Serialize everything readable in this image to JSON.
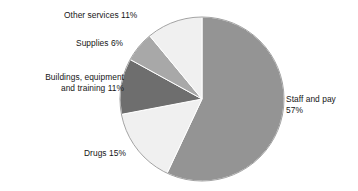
{
  "chart_data": {
    "type": "pie",
    "title": "",
    "subtitle": "",
    "xlabel": "",
    "ylabel": "",
    "legend_position": "none",
    "grid": false,
    "unit": "%",
    "start_angle_deg": 0,
    "direction": "clockwise",
    "categories": [
      "Staff and pay",
      "Drugs",
      "Buildings, equipment and training",
      "Supplies",
      "Other services"
    ],
    "values": [
      57,
      15,
      11,
      6,
      11
    ],
    "colors": [
      "#949494",
      "#f0f0f0",
      "#6e6e6e",
      "#a8a8a8",
      "#f0f0f0"
    ],
    "slice_border_color": "#ffffff",
    "background_color": "#ffffff",
    "slices": [
      {
        "name": "Staff and pay",
        "value": 57,
        "label": "Staff and pay",
        "value_label": "57%",
        "full_label": "Staff and pay 57%",
        "color": "#949494"
      },
      {
        "name": "Drugs",
        "value": 15,
        "label": "Drugs",
        "value_label": "15%",
        "full_label": "Drugs 15%",
        "color": "#f0f0f0"
      },
      {
        "name": "Buildings, equipment and training",
        "value": 11,
        "label": "Buildings, equipment",
        "value_label": "and training 11%",
        "full_label": "Buildings, equipment\nand training 11%",
        "color": "#6e6e6e"
      },
      {
        "name": "Supplies",
        "value": 6,
        "label": "Supplies",
        "value_label": "6%",
        "full_label": "Supplies 6%",
        "color": "#a8a8a8"
      },
      {
        "name": "Other services",
        "value": 11,
        "label": "Other services",
        "value_label": "11%",
        "full_label": "Other services 11%",
        "color": "#f0f0f0"
      }
    ]
  },
  "labels": {
    "staff": "Staff and pay\n57%",
    "drugs": "Drugs 15%",
    "buildings": "Buildings, equipment\nand training 11%",
    "supplies": "Supplies 6%",
    "other_services": "Other services 11%"
  }
}
